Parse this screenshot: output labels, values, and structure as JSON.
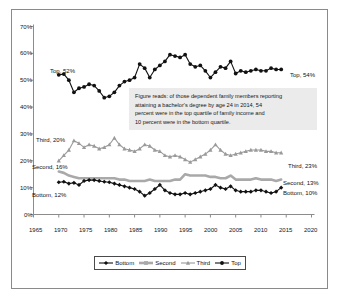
{
  "chart_data": {
    "type": "line",
    "title": "",
    "subtitle": "",
    "xlabel": "",
    "ylabel": "",
    "xlim": [
      1965,
      2020
    ],
    "ylim": [
      0,
      0.7
    ],
    "grid": false,
    "legend_position": "bottom",
    "x_tick_labels": [
      "1965",
      "1970",
      "1975",
      "1980",
      "1985",
      "1990",
      "1995",
      "2000",
      "2005",
      "2010",
      "2015",
      "2020"
    ],
    "x_ticks": [
      1965,
      1970,
      1975,
      1980,
      1985,
      1990,
      1995,
      2000,
      2005,
      2010,
      2015,
      2020
    ],
    "y_tick_labels": [
      "0%",
      "10%",
      "20%",
      "30%",
      "40%",
      "50%",
      "60%",
      "70%"
    ],
    "y_ticks": [
      0,
      10,
      20,
      30,
      40,
      50,
      60,
      70
    ],
    "x": [
      1970,
      1971,
      1972,
      1973,
      1974,
      1975,
      1976,
      1977,
      1978,
      1979,
      1980,
      1981,
      1982,
      1983,
      1984,
      1985,
      1986,
      1987,
      1988,
      1989,
      1990,
      1991,
      1992,
      1993,
      1994,
      1995,
      1996,
      1997,
      1998,
      1999,
      2000,
      2001,
      2002,
      2003,
      2004,
      2005,
      2006,
      2007,
      2008,
      2009,
      2010,
      2011,
      2012,
      2013,
      2014
    ],
    "series": [
      {
        "name": "Top",
        "color": "#111111",
        "marker": "filled-circle",
        "values": [
          52,
          52.3,
          50,
          45.5,
          47,
          47.5,
          48.5,
          48,
          46,
          43.5,
          44,
          45.5,
          48,
          49.5,
          50,
          51,
          56,
          54.5,
          51,
          54,
          55.5,
          57,
          59.5,
          59,
          58.5,
          59.5,
          56,
          55,
          55.5,
          53.5,
          51,
          53,
          55,
          54.5,
          57,
          52.5,
          53.5,
          53,
          53.5,
          54,
          53.5,
          53.5,
          54.5,
          54,
          54
        ]
      },
      {
        "name": "Third",
        "color": "#9a9a9a",
        "marker": "triangle",
        "values": [
          20,
          22,
          24,
          27.5,
          26.5,
          25,
          26,
          25.5,
          24.5,
          25,
          26,
          28.5,
          26,
          24.5,
          24,
          23.5,
          24.5,
          26,
          25.5,
          24,
          23.5,
          22,
          21.5,
          22,
          21.5,
          20.5,
          19.5,
          20.5,
          21.5,
          22.5,
          24,
          26,
          24,
          22.5,
          22,
          22.5,
          23,
          23.5,
          24,
          24,
          24,
          23.5,
          23.5,
          23,
          23
        ]
      },
      {
        "name": "Second",
        "color": "#a9a9a9",
        "marker": "square",
        "values": [
          16,
          15.5,
          14.5,
          14,
          13.5,
          13.5,
          13.5,
          13.5,
          13.5,
          13.5,
          13.5,
          13.5,
          13,
          13,
          12.5,
          12.5,
          12.5,
          12.5,
          13,
          12.5,
          12.5,
          12.5,
          12.5,
          13,
          13,
          15,
          14.5,
          14.5,
          14.5,
          14.5,
          14,
          14,
          13.5,
          13.5,
          14.5,
          13,
          13,
          13,
          13,
          13.5,
          13,
          13,
          13,
          12.5,
          13
        ]
      },
      {
        "name": "Bottom",
        "color": "#111111",
        "marker": "filled-diamond",
        "values": [
          12,
          12.2,
          11.5,
          11.8,
          11,
          12.5,
          12.8,
          12.8,
          12.5,
          12.2,
          12,
          11.5,
          11,
          10.5,
          10,
          9.5,
          8.5,
          7,
          8,
          9.5,
          11,
          9,
          8,
          7.5,
          7.5,
          8,
          7.5,
          8,
          8.5,
          9,
          9.5,
          11,
          10,
          9.5,
          10.5,
          9,
          8.5,
          8.5,
          8.5,
          9,
          9,
          8.5,
          8,
          8.5,
          10
        ]
      }
    ],
    "annotation": {
      "text": "Figure reads: of those dependent family members reporting attaining a bachelor's degree by age 24 in 2014, 54 percent were in the top quartile of family income and 10 percent were in the bottom quartile.",
      "lines": [
        "Figure reads: of those dependent family members reporting",
        "attaining a bachelor's degree by age 24 in 2014, 54",
        "percent were in the top quartile of family income and",
        "10 percent were in the bottom quartile."
      ],
      "background": "#ebebeb"
    },
    "point_labels": [
      {
        "id": "top-left",
        "text": "Top, 52%"
      },
      {
        "id": "top-right",
        "text": "Top, 54%"
      },
      {
        "id": "third-left",
        "text": "Third, 20%"
      },
      {
        "id": "third-right",
        "text": "Third, 23%"
      },
      {
        "id": "second-left",
        "text": "Second, 16%"
      },
      {
        "id": "second-right",
        "text": "Second, 13%"
      },
      {
        "id": "bottom-left",
        "text": "Bottom, 12%"
      },
      {
        "id": "bottom-right",
        "text": "Bottom, 10%"
      }
    ],
    "legend": [
      {
        "name": "Bottom",
        "color": "#111111",
        "marker": "filled-diamond"
      },
      {
        "name": "Second",
        "color": "#a9a9a9",
        "marker": "square"
      },
      {
        "name": "Third",
        "color": "#9a9a9a",
        "marker": "triangle"
      },
      {
        "name": "Top",
        "color": "#111111",
        "marker": "filled-circle"
      }
    ]
  }
}
